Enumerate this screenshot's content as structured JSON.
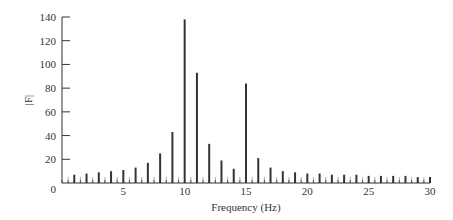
{
  "chart_data": {
    "type": "bar",
    "title": "",
    "xlabel": "Frequency (Hz)",
    "ylabel": "|F|",
    "xlim": [
      0,
      30
    ],
    "ylim": [
      0,
      140
    ],
    "xticks": [
      0,
      5,
      10,
      15,
      20,
      25,
      30
    ],
    "yticks": [
      0,
      20,
      40,
      60,
      80,
      100,
      120,
      140
    ],
    "grid": false,
    "legend": null,
    "series": [
      {
        "name": "integer harmonics",
        "style": "dark",
        "x": [
          1,
          2,
          3,
          4,
          5,
          6,
          7,
          8,
          9,
          10,
          11,
          12,
          13,
          14,
          15,
          16,
          17,
          18,
          19,
          20,
          21,
          22,
          23,
          24,
          25,
          26,
          27,
          28,
          29,
          30
        ],
        "values": [
          7,
          8,
          9,
          10,
          11,
          13,
          17,
          25,
          43,
          138,
          93,
          33,
          19,
          12,
          84,
          21,
          13,
          10,
          9,
          8,
          8,
          7,
          7,
          7,
          6,
          6,
          6,
          6,
          5,
          5
        ]
      },
      {
        "name": "half-integer components",
        "style": "light",
        "x": [
          0.5,
          1.5,
          2.5,
          3.5,
          4.5,
          5.5,
          6.5,
          7.5,
          8.5,
          9.5,
          10.5,
          11.5,
          12.5,
          13.5,
          14.5,
          15.5,
          16.5,
          17.5,
          18.5,
          19.5,
          20.5,
          21.5,
          22.5,
          23.5,
          24.5,
          25.5,
          26.5,
          27.5,
          28.5,
          29.5
        ],
        "values": [
          5,
          5,
          5,
          5,
          5,
          5,
          5,
          5,
          5,
          5,
          5,
          5,
          5,
          5,
          5,
          5,
          5,
          5,
          5,
          5,
          5,
          5,
          5,
          5,
          5,
          5,
          5,
          5,
          5,
          5
        ]
      }
    ]
  },
  "colors": {
    "axis": "#333333",
    "dark_bar": "#333333",
    "light_bar": "#bbbbbb"
  }
}
